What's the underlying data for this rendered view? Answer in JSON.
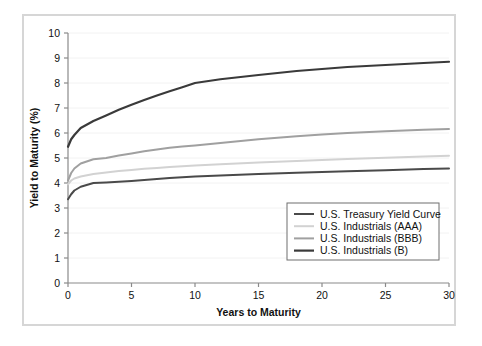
{
  "chart_data": {
    "type": "line",
    "title": "",
    "xlabel": "Years to Maturity",
    "ylabel": "Yield to Maturity (%)",
    "xlim": [
      0,
      30
    ],
    "ylim": [
      0,
      10
    ],
    "xticks": [
      "0",
      "5",
      "10",
      "15",
      "20",
      "25",
      "30"
    ],
    "yticks": [
      "0",
      "1",
      "2",
      "3",
      "4",
      "5",
      "6",
      "7",
      "8",
      "9",
      "10"
    ],
    "grid": "horizontal",
    "legend_position": "lower-right",
    "x": [
      0,
      0.25,
      0.5,
      1,
      2,
      3,
      4,
      5,
      6,
      7,
      8,
      9,
      10,
      12,
      15,
      18,
      20,
      22,
      25,
      28,
      30
    ],
    "series": [
      {
        "name": "U.S. Treasury Yield Curve",
        "color": "#4a4a4a",
        "width": 2.0,
        "values": [
          3.35,
          3.55,
          3.7,
          3.85,
          4.0,
          4.02,
          4.05,
          4.08,
          4.12,
          4.16,
          4.2,
          4.23,
          4.26,
          4.3,
          4.36,
          4.41,
          4.44,
          4.47,
          4.51,
          4.56,
          4.58
        ]
      },
      {
        "name": "U.S. Industrials (AAA)",
        "color": "#d2d2d2",
        "width": 2.0,
        "values": [
          3.95,
          4.1,
          4.18,
          4.26,
          4.36,
          4.42,
          4.48,
          4.52,
          4.57,
          4.6,
          4.64,
          4.67,
          4.7,
          4.75,
          4.82,
          4.88,
          4.92,
          4.96,
          5.01,
          5.06,
          5.09
        ]
      },
      {
        "name": "U.S. Industrials (BBB)",
        "color": "#a0a0a0",
        "width": 2.0,
        "values": [
          4.1,
          4.4,
          4.58,
          4.78,
          4.95,
          5.0,
          5.1,
          5.18,
          5.27,
          5.34,
          5.41,
          5.46,
          5.5,
          5.6,
          5.75,
          5.87,
          5.94,
          6.0,
          6.07,
          6.13,
          6.16
        ]
      },
      {
        "name": "U.S. Industrials (B)",
        "color": "#3a3a3a",
        "width": 2.2,
        "values": [
          5.45,
          5.75,
          5.92,
          6.2,
          6.48,
          6.7,
          6.93,
          7.13,
          7.32,
          7.5,
          7.67,
          7.83,
          8.0,
          8.15,
          8.32,
          8.48,
          8.56,
          8.64,
          8.72,
          8.8,
          8.85
        ]
      }
    ]
  },
  "legend": {
    "items": [
      {
        "label": "U.S. Treasury Yield Curve",
        "color": "#4a4a4a",
        "width": 2.0
      },
      {
        "label": "U.S. Industrials (AAA)",
        "color": "#d2d2d2",
        "width": 2.0
      },
      {
        "label": "U.S. Industrials (BBB)",
        "color": "#a0a0a0",
        "width": 2.0
      },
      {
        "label": "U.S. Industrials (B)",
        "color": "#3a3a3a",
        "width": 2.2
      }
    ]
  },
  "style": {
    "frame_color": "#d6d6d6",
    "axis_color": "#8a8a8a",
    "grid_color": "#f2f2f2",
    "text_color": "#111111",
    "background": "#ffffff"
  }
}
